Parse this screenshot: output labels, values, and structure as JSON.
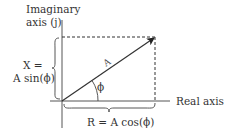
{
  "diagram": {
    "type": "phasor",
    "colors": {
      "ink": "#333333",
      "axis": "#555555",
      "background": "#ffffff"
    },
    "labels": {
      "imaginary_axis_line1": "Imaginary",
      "imaginary_axis_line2": "axis (j)",
      "real_axis": "Real axis",
      "x_eq": "X =",
      "x_expr": "A sin(ϕ)",
      "r_expr": "R = A cos(ϕ)",
      "angle": "ϕ",
      "vector": "A"
    },
    "geometry": {
      "origin": [
        62,
        101
      ],
      "vector_tip": [
        155,
        37
      ],
      "vertical_axis": {
        "x": 62,
        "y_top": 20,
        "y_bottom": 128
      },
      "horizontal_axis": {
        "y": 101,
        "x_left": 52,
        "x_right": 170
      }
    }
  }
}
